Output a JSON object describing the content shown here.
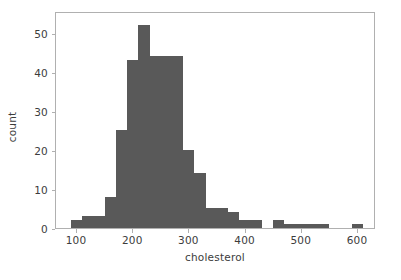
{
  "figure": {
    "background_color": "#ffffff",
    "frame_color": "#b0b0b0",
    "tick_color": "#b0b0b0",
    "text_color": "#3c3c3c"
  },
  "chart_data": {
    "type": "bar",
    "subtype": "histogram",
    "title": "",
    "xlabel": "cholesterol",
    "ylabel": "count",
    "bar_color": "#595959",
    "grid": false,
    "legend": null,
    "xlim": [
      62.6,
      632.0
    ],
    "ylim": [
      0,
      55.5
    ],
    "xticks": [
      100,
      200,
      300,
      400,
      500,
      600
    ],
    "xtick_labels": [
      "100",
      "200",
      "300",
      "400",
      "500",
      "600"
    ],
    "yticks": [
      0,
      10,
      20,
      30,
      40,
      50
    ],
    "ytick_labels": [
      "0",
      "10",
      "20",
      "30",
      "40",
      "50"
    ],
    "bin_width": 20,
    "bin_edges": [
      89,
      109,
      129,
      149,
      169,
      189,
      209,
      229,
      249,
      269,
      289,
      309,
      329,
      349,
      369,
      389,
      409,
      429,
      449,
      469,
      489,
      509,
      529,
      549,
      569,
      589,
      609
    ],
    "bins": [
      {
        "x0": 89,
        "x1": 109,
        "count": 2
      },
      {
        "x0": 109,
        "x1": 129,
        "count": 3
      },
      {
        "x0": 129,
        "x1": 149,
        "count": 3
      },
      {
        "x0": 149,
        "x1": 169,
        "count": 8
      },
      {
        "x0": 169,
        "x1": 189,
        "count": 25
      },
      {
        "x0": 189,
        "x1": 209,
        "count": 43
      },
      {
        "x0": 209,
        "x1": 229,
        "count": 52
      },
      {
        "x0": 229,
        "x1": 249,
        "count": 44
      },
      {
        "x0": 249,
        "x1": 269,
        "count": 44
      },
      {
        "x0": 269,
        "x1": 289,
        "count": 44
      },
      {
        "x0": 289,
        "x1": 309,
        "count": 20
      },
      {
        "x0": 309,
        "x1": 329,
        "count": 14
      },
      {
        "x0": 329,
        "x1": 349,
        "count": 5
      },
      {
        "x0": 349,
        "x1": 369,
        "count": 5
      },
      {
        "x0": 369,
        "x1": 389,
        "count": 4
      },
      {
        "x0": 389,
        "x1": 409,
        "count": 2
      },
      {
        "x0": 409,
        "x1": 429,
        "count": 2
      },
      {
        "x0": 429,
        "x1": 449,
        "count": 0
      },
      {
        "x0": 449,
        "x1": 469,
        "count": 2
      },
      {
        "x0": 469,
        "x1": 489,
        "count": 1
      },
      {
        "x0": 489,
        "x1": 509,
        "count": 1
      },
      {
        "x0": 509,
        "x1": 529,
        "count": 1
      },
      {
        "x0": 529,
        "x1": 549,
        "count": 1
      },
      {
        "x0": 549,
        "x1": 569,
        "count": 0
      },
      {
        "x0": 569,
        "x1": 589,
        "count": 0
      },
      {
        "x0": 589,
        "x1": 609,
        "count": 1
      }
    ]
  }
}
